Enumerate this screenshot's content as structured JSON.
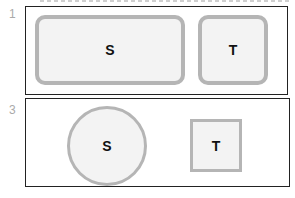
{
  "panels": [
    {
      "number": "1",
      "shapes": [
        {
          "label": "S",
          "shape": "rounded-rectangle"
        },
        {
          "label": "T",
          "shape": "rounded-rectangle"
        }
      ]
    },
    {
      "number": "3",
      "shapes": [
        {
          "label": "S",
          "shape": "circle"
        },
        {
          "label": "T",
          "shape": "square"
        }
      ]
    }
  ],
  "colors": {
    "outline": "#b5b5b5",
    "fill": "#f3f3f3",
    "frame": "#222222"
  }
}
